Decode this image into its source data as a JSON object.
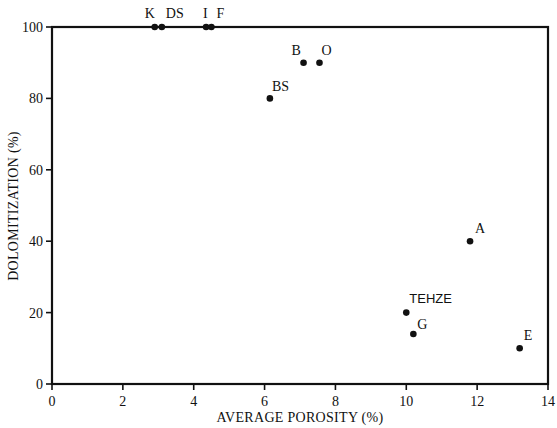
{
  "chart_data": {
    "type": "scatter",
    "title": "",
    "xlabel": "AVERAGE POROSITY (%)",
    "ylabel": "DOLOMITIZATION (%)",
    "xlim": [
      0,
      14
    ],
    "ylim": [
      0,
      100
    ],
    "xticks": [
      0,
      2,
      4,
      6,
      8,
      10,
      12,
      14
    ],
    "yticks": [
      0,
      20,
      40,
      60,
      80,
      100
    ],
    "grid": false,
    "legend": null,
    "points": [
      {
        "label": "K",
        "x": 2.9,
        "y": 100
      },
      {
        "label": "DS",
        "x": 3.1,
        "y": 100
      },
      {
        "label": "I",
        "x": 4.35,
        "y": 100
      },
      {
        "label": "F",
        "x": 4.5,
        "y": 100
      },
      {
        "label": "B",
        "x": 7.1,
        "y": 90
      },
      {
        "label": "O",
        "x": 7.55,
        "y": 90
      },
      {
        "label": "BS",
        "x": 6.15,
        "y": 80
      },
      {
        "label": "A",
        "x": 11.8,
        "y": 40
      },
      {
        "label": "TEHZE",
        "x": 10.0,
        "y": 20
      },
      {
        "label": "G",
        "x": 10.2,
        "y": 14
      },
      {
        "label": "E",
        "x": 13.2,
        "y": 10
      }
    ]
  },
  "labels": {
    "x_axis_title": "AVERAGE POROSITY (%)",
    "y_axis_title": "DOLOMITIZATION (%)"
  }
}
